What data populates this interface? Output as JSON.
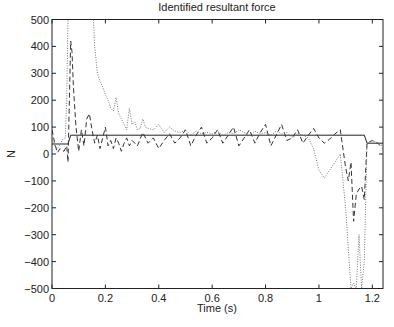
{
  "chart_data": {
    "type": "line",
    "title": "Identified resultant force",
    "xlabel": "Time (s)",
    "ylabel": "N",
    "xlim": [
      0,
      1.24
    ],
    "ylim": [
      -500,
      500
    ],
    "xticks": [
      0,
      0.2,
      0.4,
      0.6,
      0.8,
      1,
      1.2
    ],
    "xtick_labels": [
      "0",
      "0.2",
      "0.4",
      "0.6",
      "0.8",
      "1",
      "1.2"
    ],
    "yticks": [
      500,
      400,
      300,
      200,
      100,
      0,
      -100,
      -200,
      -300,
      -400,
      -500
    ],
    "ytick_labels": [
      "500",
      "400",
      "300",
      "200",
      "100",
      "0",
      "−100",
      "−200",
      "−300",
      "−400",
      "−500"
    ],
    "grid": false,
    "legend": null,
    "series": [
      {
        "name": "solid",
        "style": "solid",
        "color": "#222222",
        "x": [
          0,
          0.06,
          0.07,
          1.17,
          1.18,
          1.24
        ],
        "y": [
          37,
          37,
          70,
          70,
          40,
          40
        ]
      },
      {
        "name": "dashed",
        "style": "dashed",
        "color": "#333333",
        "x": [
          0,
          0.01,
          0.02,
          0.03,
          0.045,
          0.055,
          0.06,
          0.07,
          0.075,
          0.08,
          0.09,
          0.1,
          0.11,
          0.12,
          0.13,
          0.14,
          0.15,
          0.16,
          0.17,
          0.18,
          0.19,
          0.2,
          0.21,
          0.22,
          0.23,
          0.24,
          0.25,
          0.26,
          0.27,
          0.28,
          0.29,
          0.3,
          0.32,
          0.34,
          0.36,
          0.38,
          0.4,
          0.42,
          0.44,
          0.46,
          0.48,
          0.5,
          0.52,
          0.54,
          0.56,
          0.58,
          0.6,
          0.62,
          0.64,
          0.66,
          0.68,
          0.7,
          0.72,
          0.74,
          0.76,
          0.78,
          0.8,
          0.82,
          0.84,
          0.86,
          0.88,
          0.9,
          0.92,
          0.94,
          0.96,
          0.98,
          1.0,
          1.02,
          1.04,
          1.06,
          1.08,
          1.1,
          1.11,
          1.12,
          1.13,
          1.14,
          1.15,
          1.16,
          1.17,
          1.18,
          1.2,
          1.22,
          1.24
        ],
        "y": [
          90,
          40,
          5,
          20,
          10,
          30,
          -30,
          420,
          380,
          250,
          100,
          10,
          90,
          30,
          130,
          150,
          90,
          40,
          70,
          20,
          60,
          100,
          30,
          50,
          20,
          60,
          40,
          10,
          40,
          60,
          30,
          50,
          30,
          80,
          40,
          60,
          20,
          50,
          75,
          40,
          60,
          90,
          30,
          70,
          100,
          40,
          60,
          90,
          40,
          70,
          100,
          30,
          60,
          90,
          40,
          80,
          110,
          30,
          70,
          110,
          50,
          60,
          90,
          40,
          70,
          95,
          60,
          40,
          55,
          75,
          90,
          -50,
          -100,
          -30,
          -250,
          -150,
          -130,
          -120,
          -170,
          40,
          50,
          40,
          20
        ]
      },
      {
        "name": "dotted",
        "style": "dotted",
        "color": "#777777",
        "x": [
          0,
          0.01,
          0.02,
          0.03,
          0.04,
          0.05,
          0.055,
          0.06,
          0.065,
          0.155,
          0.16,
          0.17,
          0.18,
          0.19,
          0.2,
          0.21,
          0.22,
          0.23,
          0.24,
          0.25,
          0.26,
          0.27,
          0.28,
          0.29,
          0.3,
          0.31,
          0.32,
          0.33,
          0.34,
          0.35,
          0.36,
          0.38,
          0.4,
          0.42,
          0.44,
          0.46,
          0.48,
          0.5,
          0.52,
          0.54,
          0.56,
          0.58,
          0.6,
          0.62,
          0.64,
          0.66,
          0.68,
          0.7,
          0.72,
          0.74,
          0.76,
          0.78,
          0.8,
          0.82,
          0.84,
          0.86,
          0.88,
          0.9,
          0.92,
          0.94,
          0.96,
          0.98,
          1.0,
          1.02,
          1.04,
          1.06,
          1.08,
          1.1,
          1.12,
          1.13,
          1.14,
          1.15,
          1.16,
          1.17,
          1.18,
          1.2,
          1.22,
          1.24
        ],
        "y": [
          60,
          30,
          20,
          35,
          55,
          60,
          200,
          500,
          500,
          500,
          400,
          300,
          270,
          250,
          220,
          200,
          170,
          160,
          210,
          150,
          130,
          110,
          90,
          170,
          110,
          120,
          90,
          95,
          130,
          100,
          95,
          90,
          110,
          80,
          100,
          85,
          80,
          90,
          70,
          85,
          75,
          80,
          75,
          85,
          70,
          80,
          75,
          90,
          80,
          70,
          85,
          75,
          80,
          70,
          85,
          75,
          80,
          60,
          75,
          70,
          60,
          20,
          -60,
          -90,
          -60,
          -30,
          0,
          -200,
          -500,
          -480,
          -500,
          -300,
          -500,
          -400,
          40,
          50,
          40,
          30
        ]
      }
    ]
  }
}
